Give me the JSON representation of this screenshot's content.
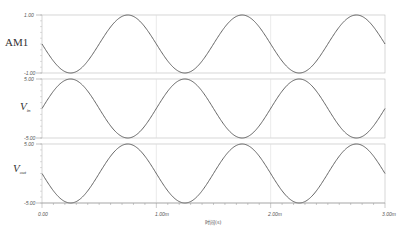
{
  "chart_data": {
    "type": "line",
    "title": "",
    "xlabel": "时间(s)",
    "x_range": [
      0,
      3.0
    ],
    "x_unit": "ms",
    "x_ticks": [
      {
        "value": 0,
        "label": "0.00"
      },
      {
        "value": 1.0,
        "label": "1.00m"
      },
      {
        "value": 2.0,
        "label": "2.00m"
      },
      {
        "value": 3.0,
        "label": "3.00m"
      }
    ],
    "grid": {
      "vertical_at": [
        1.0,
        2.0
      ]
    },
    "panels": [
      {
        "name": "AM1",
        "label": "AM1",
        "ylim": [
          -1.0,
          1.0
        ],
        "y_top_label": "1.00",
        "y_bottom_label": "-1.00",
        "function": "-sin(2*pi*t/1ms)",
        "amplitude": 1.0,
        "period_ms": 1.0,
        "phase": "starts at 0, decreasing",
        "x": [
          0,
          0.25,
          0.5,
          0.75,
          1.0,
          1.25,
          1.5,
          1.75,
          2.0,
          2.25,
          2.5,
          2.75,
          3.0
        ],
        "values": [
          0,
          -1,
          0,
          1,
          0,
          -1,
          0,
          1,
          0,
          -1,
          0,
          1,
          0
        ]
      },
      {
        "name": "Vin",
        "label": "V",
        "label_sub": "in",
        "ylim": [
          -5.0,
          5.0
        ],
        "y_top_label": "5.00",
        "y_bottom_label": "-5.00",
        "function": "5*sin(2*pi*t/1ms)",
        "amplitude": 5.0,
        "period_ms": 1.0,
        "phase": "starts at 0, increasing",
        "x": [
          0,
          0.25,
          0.5,
          0.75,
          1.0,
          1.25,
          1.5,
          1.75,
          2.0,
          2.25,
          2.5,
          2.75,
          3.0
        ],
        "values": [
          0,
          5,
          0,
          -5,
          0,
          5,
          0,
          -5,
          0,
          5,
          0,
          -5,
          0
        ]
      },
      {
        "name": "Vout",
        "label": "V",
        "label_sub": "out",
        "ylim": [
          -5.0,
          5.0
        ],
        "y_top_label": "5.00",
        "y_bottom_label": "-5.00",
        "function": "-5*sin(2*pi*t/1ms)",
        "amplitude": 5.0,
        "period_ms": 1.0,
        "phase": "starts at 0, decreasing",
        "x": [
          0,
          0.25,
          0.5,
          0.75,
          1.0,
          1.25,
          1.5,
          1.75,
          2.0,
          2.25,
          2.5,
          2.75,
          3.0
        ],
        "values": [
          0,
          -5,
          0,
          5,
          0,
          -5,
          0,
          5,
          0,
          -5,
          0,
          5,
          0
        ]
      }
    ],
    "colors": {
      "trace": "#555555",
      "frame": "#bbbbbb",
      "grid": "#dddddd",
      "background": "#ffffff"
    }
  },
  "labels": {
    "panel1": "AM1",
    "panel2_main": "V",
    "panel2_sub": "in",
    "panel3_main": "V",
    "panel3_sub": "out",
    "p1_top": "1.00",
    "p1_bottom": "-1.00",
    "p2_top": "5.00",
    "p2_bottom": "-5.00",
    "p3_top": "5.00",
    "p3_bottom": "-5.00",
    "x0": "0.00",
    "x1": "1.00m",
    "x2": "2.00m",
    "x3": "3.00m",
    "xlabel": "时间(s)"
  }
}
